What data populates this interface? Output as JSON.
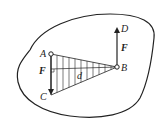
{
  "diagram": {
    "title": "",
    "labels": {
      "A": "A",
      "B": "B",
      "C": "C",
      "D": "D",
      "force_left": "F",
      "force_right": "F",
      "distance": "d"
    },
    "colors": {
      "stroke": "#222222",
      "background": "#ffffff"
    }
  }
}
